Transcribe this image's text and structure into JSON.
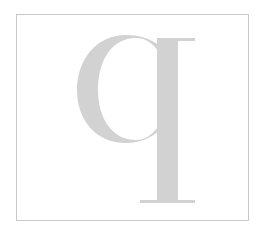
{
  "glyph": {
    "character": "q",
    "description": "Large serif lowercase q letterform",
    "color": "#d2d2d2"
  },
  "frame": {
    "border_color": "#c8c8c8",
    "background": "#ffffff"
  }
}
